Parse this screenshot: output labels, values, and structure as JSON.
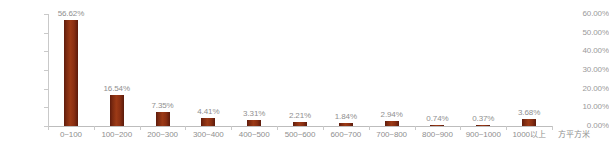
{
  "chart_data": {
    "type": "bar",
    "title": "",
    "xlabel": "方平方米",
    "ylabel": "",
    "ylim": [
      0,
      60
    ],
    "grid": false,
    "legend": null,
    "categories": [
      "0~100",
      "100~200",
      "200~300",
      "300~400",
      "400~500",
      "500~600",
      "600~700",
      "700~800",
      "800~900",
      "900~1000",
      "1000以上"
    ],
    "values": [
      56.62,
      16.54,
      7.35,
      4.41,
      3.31,
      2.21,
      1.84,
      2.94,
      0.74,
      0.37,
      3.68
    ],
    "value_labels": [
      "56.62%",
      "16.54%",
      "7.35%",
      "4.41%",
      "3.31%",
      "2.21%",
      "1.84%",
      "2.94%",
      "0.74%",
      "0.37%",
      "3.68%"
    ],
    "y_tick_labels": [
      "0.00%",
      "10.00%",
      "20.00%",
      "30.00%",
      "40.00%",
      "50.00%",
      "60.00%"
    ],
    "y_tick_values": [
      0,
      10,
      20,
      30,
      40,
      50,
      60
    ],
    "bar_color": "#8a2f12",
    "axis_color": "#c9c9c9",
    "label_color": "#8f8f8f"
  }
}
